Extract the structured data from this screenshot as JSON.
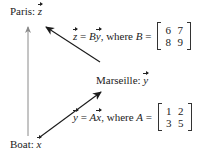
{
  "nodes": {
    "paris": {
      "name": "Paris:",
      "var": "z"
    },
    "marseille": {
      "name": "Marseille:",
      "var": "y"
    },
    "boat": {
      "name": "Boat:",
      "var": "x"
    }
  },
  "equations": {
    "top": {
      "lhs": "z",
      "eq": " = ",
      "mat": "B",
      "rhs": "y",
      "where": ", where ",
      "matname": "B",
      "eq2": " = ",
      "matrix": [
        [
          "6",
          "7"
        ],
        [
          "8",
          "9"
        ]
      ]
    },
    "bottom": {
      "lhs": "y",
      "eq": " = ",
      "mat": "A",
      "rhs": "x",
      "where": ", where ",
      "matname": "A",
      "eq2": " = ",
      "matrix": [
        [
          "1",
          "2"
        ],
        [
          "3",
          "5"
        ]
      ]
    }
  },
  "colors": {
    "direct_arrow": "#8a8a8a",
    "path_arrow": "#1a1a1a"
  }
}
